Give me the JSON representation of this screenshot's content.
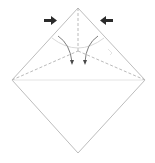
{
  "diagram": {
    "type": "origami-fold-step",
    "colors": {
      "background": "#ffffff",
      "paper_edge": "#bdbdbd",
      "crease": "#9e9e9e",
      "arrow": "#2b2b2b",
      "curve_arrow": "#6e6e6e"
    },
    "shapes": {
      "square_outline": "diamond",
      "push_arrows": [
        "push-arrow-right",
        "push-arrow-left"
      ],
      "fold_arrows": [
        "curved-fold-arrow-left",
        "curved-fold-arrow-right"
      ]
    }
  }
}
